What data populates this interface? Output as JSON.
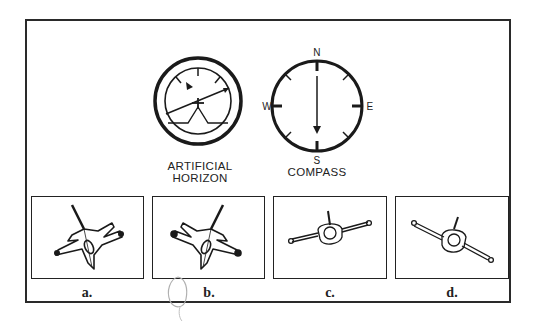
{
  "instruments": {
    "artificial_horizon": {
      "label_line1": "ARTIFICIAL",
      "label_line2": "HORIZON"
    },
    "compass": {
      "label": "COMPASS",
      "directions": {
        "north": "N",
        "east": "E",
        "south": "S",
        "west": "W"
      },
      "heading": "S"
    }
  },
  "choices": [
    {
      "id": "a",
      "label": "a."
    },
    {
      "id": "b",
      "label": "b."
    },
    {
      "id": "c",
      "label": "c."
    },
    {
      "id": "d",
      "label": "d."
    }
  ],
  "colors": {
    "ink": "#222222",
    "pencil": "#b0b0b0",
    "background": "#ffffff"
  }
}
